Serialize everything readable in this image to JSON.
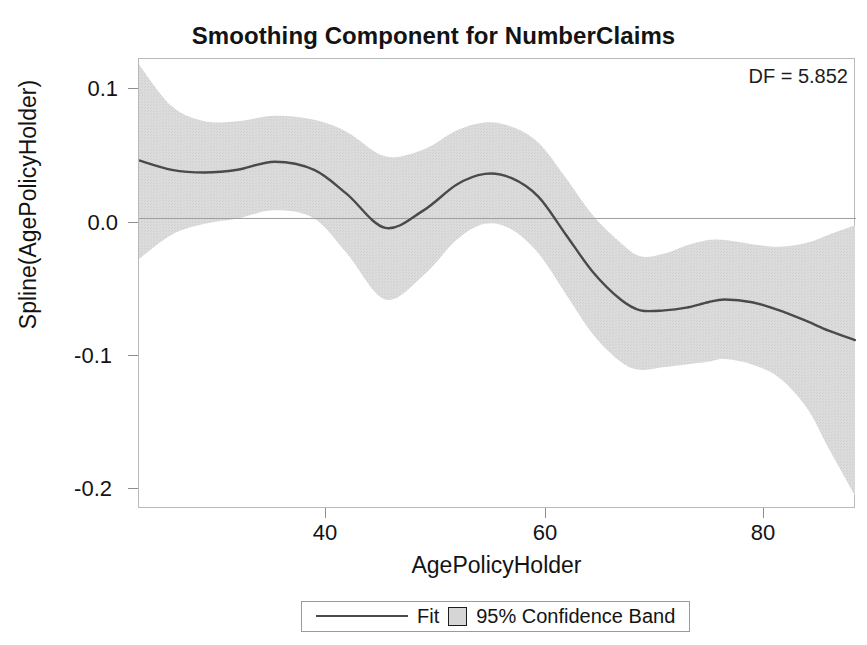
{
  "chart_data": {
    "type": "line",
    "title": "Smoothing Component for NumberClaims",
    "subtitle": "",
    "xlabel": "AgePolicyHolder",
    "ylabel": "Spline(AgePolicyHolder)",
    "annotation": "DF = 5.852",
    "xlim": [
      23,
      88.5
    ],
    "ylim": [
      -0.215,
      0.118
    ],
    "xticks": [
      40,
      60,
      80
    ],
    "xtick_labels": [
      "40",
      "60",
      "80"
    ],
    "yticks": [
      0.1,
      0.0,
      -0.1,
      -0.2
    ],
    "ytick_labels": [
      "0.1",
      "0.0",
      "-0.1",
      "-0.2"
    ],
    "grid": false,
    "zero_reference_line": 0.0,
    "legend_position": "below-plot",
    "colors": {
      "fit_line": "#4a4a4a",
      "confidence_band": "#d8d8d8",
      "axis": "#b9b9b9",
      "text": "#131313"
    },
    "series": [
      {
        "name": "Fit",
        "type": "line",
        "x": [
          23,
          26,
          29,
          32,
          35.4,
          39,
          42,
          45.5,
          49,
          52,
          54.6,
          57,
          59.5,
          62,
          64.5,
          67,
          68.8,
          71,
          73,
          75,
          76.5,
          79,
          81.5,
          84,
          86,
          88.4
        ],
        "y": [
          0.043,
          0.036,
          0.034,
          0.036,
          0.042,
          0.036,
          0.018,
          -0.007,
          0.006,
          0.025,
          0.033,
          0.03,
          0.016,
          -0.012,
          -0.04,
          -0.06,
          -0.068,
          -0.068,
          -0.066,
          -0.062,
          -0.06,
          -0.062,
          -0.068,
          -0.076,
          -0.083,
          -0.09
        ]
      },
      {
        "name": "95% Confidence Band",
        "type": "band",
        "x": [
          23,
          26,
          29,
          32,
          35.4,
          39,
          42,
          45.5,
          49,
          52,
          54.6,
          57,
          59.5,
          62,
          64.5,
          67,
          68.8,
          71,
          73,
          75,
          76.5,
          79,
          81.5,
          84,
          86,
          88.4
        ],
        "upper": [
          0.114,
          0.083,
          0.072,
          0.072,
          0.076,
          0.073,
          0.064,
          0.046,
          0.051,
          0.065,
          0.071,
          0.068,
          0.056,
          0.03,
          0.002,
          -0.018,
          -0.028,
          -0.026,
          -0.02,
          -0.016,
          -0.016,
          -0.019,
          -0.021,
          -0.018,
          -0.012,
          -0.005
        ],
        "lower": [
          -0.03,
          -0.012,
          -0.004,
          0.0,
          0.006,
          0.0,
          -0.026,
          -0.06,
          -0.042,
          -0.016,
          -0.004,
          -0.008,
          -0.026,
          -0.056,
          -0.086,
          -0.106,
          -0.112,
          -0.11,
          -0.108,
          -0.106,
          -0.104,
          -0.108,
          -0.118,
          -0.14,
          -0.17,
          -0.205
        ]
      }
    ]
  },
  "header": {
    "title": "Smoothing Component for NumberClaims"
  },
  "plot": {
    "df_note": "DF = 5.852",
    "y_axis_title": "Spline(AgePolicyHolder)",
    "x_axis_title": "AgePolicyHolder"
  },
  "legend": {
    "fit_label": "Fit",
    "band_label": "95% Confidence Band"
  }
}
